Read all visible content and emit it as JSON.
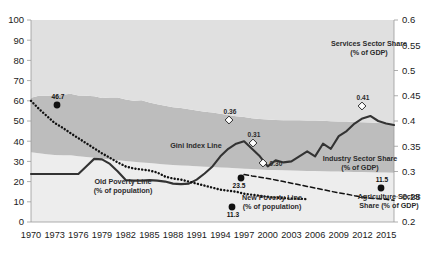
{
  "chart_data": {
    "type": "area",
    "title": "",
    "subtitle": "",
    "xlabel": "",
    "ylabel": "",
    "y2label": "",
    "grid": false,
    "legend_position": "inline-annotations",
    "x": [
      1970,
      1971,
      1972,
      1973,
      1974,
      1975,
      1976,
      1977,
      1978,
      1979,
      1980,
      1981,
      1982,
      1983,
      1984,
      1985,
      1986,
      1987,
      1988,
      1989,
      1990,
      1991,
      1992,
      1993,
      1994,
      1995,
      1996,
      1997,
      1998,
      1999,
      2000,
      2001,
      2002,
      2003,
      2004,
      2005,
      2006,
      2007,
      2008,
      2009,
      2010,
      2011,
      2012,
      2013,
      2014,
      2015,
      2016
    ],
    "xticks": [
      "1970",
      "1973",
      "1976",
      "1979",
      "1982",
      "1985",
      "1988",
      "1991",
      "1994",
      "1997",
      "2000",
      "2003",
      "2006",
      "2009",
      "2012",
      "2015"
    ],
    "ylim": [
      0,
      100
    ],
    "yticks": [
      "0",
      "10",
      "20",
      "30",
      "40",
      "50",
      "60",
      "70",
      "80",
      "90",
      "100"
    ],
    "y2lim": [
      0.2,
      0.6
    ],
    "y2ticks": [
      "0.2",
      "0.25",
      "0.3",
      "0.35",
      "0.4",
      "0.45",
      "0.5",
      "0.55",
      "0.6"
    ],
    "series": [
      {
        "name": "Agriculture Sector Share (% of GDP)",
        "type": "area-band",
        "axis": "right",
        "color": "#e8e8e8",
        "values": [
          0.345,
          0.34,
          0.335,
          0.332,
          0.33,
          0.33,
          0.326,
          0.322,
          0.318,
          0.314,
          0.31,
          0.306,
          0.302,
          0.298,
          0.295,
          0.292,
          0.288,
          0.285,
          0.282,
          0.28,
          0.278,
          0.276,
          0.274,
          0.272,
          0.27,
          0.268,
          0.266,
          0.264,
          0.262,
          0.26,
          0.258,
          0.257,
          0.256,
          0.255,
          0.254,
          0.253,
          0.252,
          0.251,
          0.25,
          0.25,
          0.249,
          0.248,
          0.247,
          0.246,
          0.245,
          0.245,
          0.244
        ]
      },
      {
        "name": "Industry Sector Share (% of GDP)",
        "type": "area-band",
        "axis": "right",
        "color": "#bdbdbd",
        "values": [
          0.27,
          0.285,
          0.29,
          0.295,
          0.3,
          0.305,
          0.3,
          0.303,
          0.305,
          0.3,
          0.306,
          0.31,
          0.305,
          0.302,
          0.308,
          0.3,
          0.295,
          0.29,
          0.286,
          0.284,
          0.28,
          0.276,
          0.272,
          0.27,
          0.266,
          0.262,
          0.258,
          0.256,
          0.252,
          0.25,
          0.25,
          0.248,
          0.248,
          0.249,
          0.25,
          0.25,
          0.251,
          0.25,
          0.249,
          0.248,
          0.248,
          0.247,
          0.247,
          0.246,
          0.245,
          0.244,
          0.243
        ]
      },
      {
        "name": "Services Sector Share (% of GDP)",
        "type": "area-band",
        "axis": "right",
        "color": "#e0e0e0",
        "values": [
          0.385,
          0.375,
          0.375,
          0.373,
          0.37,
          0.365,
          0.374,
          0.375,
          0.377,
          0.386,
          0.384,
          0.384,
          0.393,
          0.4,
          0.397,
          0.408,
          0.417,
          0.425,
          0.432,
          0.436,
          0.442,
          0.448,
          0.454,
          0.458,
          0.464,
          0.47,
          0.476,
          0.48,
          0.486,
          0.49,
          0.492,
          0.495,
          0.496,
          0.496,
          0.496,
          0.497,
          0.497,
          0.499,
          0.501,
          0.502,
          0.503,
          0.505,
          0.506,
          0.508,
          0.51,
          0.511,
          0.513
        ]
      },
      {
        "name": "Gini Index Line",
        "type": "line",
        "axis": "right",
        "color": "#333333",
        "style": "solid",
        "values": [
          0.295,
          0.295,
          0.295,
          0.295,
          0.295,
          0.295,
          0.295,
          0.31,
          0.325,
          0.324,
          0.315,
          0.3,
          0.283,
          0.282,
          0.282,
          0.283,
          0.282,
          0.28,
          0.276,
          0.275,
          0.276,
          0.284,
          0.296,
          0.31,
          0.33,
          0.345,
          0.355,
          0.36,
          0.345,
          0.33,
          0.31,
          0.322,
          0.318,
          0.32,
          0.33,
          0.34,
          0.33,
          0.355,
          0.345,
          0.37,
          0.38,
          0.395,
          0.405,
          0.41,
          0.4,
          0.395,
          0.392
        ]
      },
      {
        "name": "Old Poverty Line (% of population)",
        "type": "line",
        "axis": "left",
        "color": "#111111",
        "style": "dotted",
        "values": [
          60.0,
          56.0,
          52.5,
          49.0,
          46.7,
          44.0,
          41.5,
          39.0,
          36.5,
          34.0,
          31.8,
          29.5,
          27.5,
          26.5,
          26.0,
          25.5,
          24.5,
          22.5,
          21.5,
          21.0,
          20.0,
          19.0,
          18.0,
          17.0,
          16.0,
          15.5,
          15.0,
          14.0,
          13.5,
          13.0,
          12.5,
          12.0,
          11.8,
          11.6,
          11.5,
          11.3,
          null,
          null,
          null,
          null,
          null,
          null,
          null,
          null,
          null,
          null,
          null
        ]
      },
      {
        "name": "New Poverty Line (% of population)",
        "type": "line",
        "axis": "left",
        "color": "#111111",
        "style": "dashed",
        "values": [
          null,
          null,
          null,
          null,
          null,
          null,
          null,
          null,
          null,
          null,
          null,
          null,
          null,
          null,
          null,
          null,
          null,
          null,
          null,
          null,
          null,
          null,
          null,
          null,
          null,
          null,
          null,
          23.5,
          22.8,
          22.2,
          21.5,
          20.8,
          20.0,
          19.2,
          18.4,
          17.6,
          16.8,
          16.0,
          15.2,
          14.4,
          13.8,
          13.0,
          12.4,
          11.8,
          11.5,
          11.2,
          10.8
        ]
      }
    ],
    "annotations": [
      {
        "id": "ann-46-7",
        "text": "46.7",
        "x": 1974,
        "y": 46.7,
        "axis": "left",
        "marker": "dot-black",
        "px": 57,
        "py": 105
      },
      {
        "id": "ann-11-3",
        "text": "11.3",
        "x": 2005,
        "y": 11.3,
        "axis": "left",
        "marker": "dot-black",
        "px": 232,
        "py": 207
      },
      {
        "id": "ann-23-5",
        "text": "23.5",
        "x": 1997,
        "y": 23.5,
        "axis": "left",
        "marker": "dot-black",
        "px": 241,
        "py": 178
      },
      {
        "id": "ann-11-5",
        "text": "11.5",
        "x": 2013,
        "y": 11.5,
        "axis": "left",
        "marker": "dot-black",
        "px": 381,
        "py": 188
      },
      {
        "id": "ann-0-36",
        "text": "0.36",
        "x": 1997,
        "y": 0.36,
        "axis": "right",
        "marker": "diamond-white",
        "px": 229,
        "py": 120
      },
      {
        "id": "ann-0-31",
        "text": "0.31",
        "x": 2000,
        "y": 0.31,
        "axis": "right",
        "marker": "diamond-white",
        "px": 253,
        "py": 143
      },
      {
        "id": "ann-0-30",
        "text": "0.30",
        "x": 2001,
        "y": 0.3,
        "axis": "right",
        "marker": "diamond-white",
        "px": 263,
        "py": 163
      },
      {
        "id": "ann-0-41",
        "text": "0.41",
        "x": 2012,
        "y": 0.41,
        "axis": "right",
        "marker": "diamond-white",
        "px": 362,
        "py": 106
      }
    ],
    "inline_labels": [
      {
        "id": "label-services",
        "lines": [
          "Services Sector Share",
          "(% of GDP)"
        ],
        "px": 369,
        "py": 46
      },
      {
        "id": "label-industry",
        "lines": [
          "Industry Sector Share",
          "(% of GDP)"
        ],
        "px": 360,
        "py": 161
      },
      {
        "id": "label-agriculture",
        "lines": [
          "Agriculture Sector",
          "Share (% of GDP)"
        ],
        "px": 389,
        "py": 199
      },
      {
        "id": "label-gini",
        "lines": [
          "Gini Index Line"
        ],
        "px": 196,
        "py": 148
      },
      {
        "id": "label-old-poverty",
        "lines": [
          "Old Poverty Line",
          "(% of population)"
        ],
        "px": 123,
        "py": 184
      },
      {
        "id": "label-new-poverty",
        "lines": [
          "New Poverty Line",
          "(% of population)"
        ],
        "px": 272,
        "py": 200
      }
    ],
    "colors": {
      "services_band": "#e0e0e0",
      "industry_band": "#bdbdbd",
      "agriculture_band": "#ededed",
      "gini_line": "#333333",
      "poverty_line": "#111111",
      "axis_text": "#1a1a1a",
      "background": "#ffffff"
    }
  }
}
